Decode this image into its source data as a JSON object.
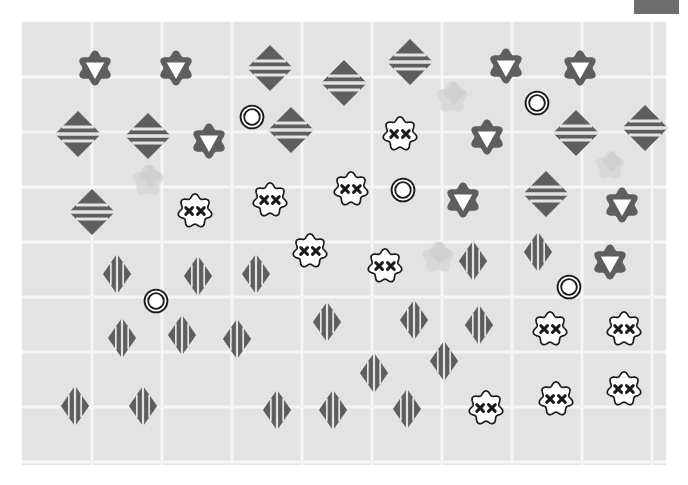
{
  "scene": {
    "title": "abstract-shape-grid-board",
    "canvas": {
      "width": 688,
      "height": 485
    },
    "board": {
      "x": 22,
      "y": 22,
      "width": 644,
      "height": 443
    },
    "background_color": "#ffffff",
    "board_color": "#e3e3e3",
    "grid": {
      "visible": true,
      "line_color": "#f5f5f5",
      "line_width": 3,
      "cell_width": 70,
      "cell_height": 55,
      "columns": 9,
      "rows": 8
    },
    "palette": {
      "dark_gray": "#5e5e5e",
      "mid_gray": "#6e6e6e",
      "ghost_gray": "#d6d6d6",
      "white": "#ffffff",
      "outline_black": "#1a1a1a"
    },
    "hud_block": {
      "label": "hud-block",
      "color": "#6e6e6e",
      "x": 634,
      "y": 0,
      "width": 45,
      "height": 14
    }
  },
  "legend": {
    "types": [
      {
        "key": "flower-triangle",
        "label": "dark flower with white down triangle",
        "color": "#5e5e5e"
      },
      {
        "key": "diamond-hstripe",
        "label": "dark diamond with horizontal stripes",
        "color": "#5e5e5e"
      },
      {
        "key": "diamond-vstripe",
        "label": "dark diamond with vertical stripes",
        "color": "#5e5e5e"
      },
      {
        "key": "cloud-xx",
        "label": "white cloud with two X marks",
        "color": "#ffffff"
      },
      {
        "key": "double-ring",
        "label": "white circle with double ring",
        "color": "#ffffff"
      },
      {
        "key": "ghost-blob",
        "label": "faint gray blob",
        "color": "#d6d6d6"
      }
    ]
  },
  "pieces": [
    {
      "type": "flower-triangle",
      "x": 95,
      "y": 68,
      "size": 46
    },
    {
      "type": "flower-triangle",
      "x": 176,
      "y": 68,
      "size": 46
    },
    {
      "type": "diamond-hstripe",
      "x": 270,
      "y": 68,
      "size": 50
    },
    {
      "type": "diamond-hstripe",
      "x": 344,
      "y": 83,
      "size": 50
    },
    {
      "type": "diamond-hstripe",
      "x": 410,
      "y": 62,
      "size": 50
    },
    {
      "type": "flower-triangle",
      "x": 506,
      "y": 66,
      "size": 46
    },
    {
      "type": "flower-triangle",
      "x": 580,
      "y": 68,
      "size": 46
    },
    {
      "type": "ghost-blob",
      "x": 452,
      "y": 97,
      "size": 42
    },
    {
      "type": "double-ring",
      "x": 252,
      "y": 117,
      "size": 26
    },
    {
      "type": "double-ring",
      "x": 537,
      "y": 103,
      "size": 26
    },
    {
      "type": "diamond-hstripe",
      "x": 78,
      "y": 134,
      "size": 50
    },
    {
      "type": "diamond-hstripe",
      "x": 148,
      "y": 136,
      "size": 50
    },
    {
      "type": "flower-triangle",
      "x": 209,
      "y": 141,
      "size": 46
    },
    {
      "type": "diamond-hstripe",
      "x": 291,
      "y": 130,
      "size": 50
    },
    {
      "type": "cloud-xx",
      "x": 400,
      "y": 134,
      "size": 42
    },
    {
      "type": "flower-triangle",
      "x": 487,
      "y": 137,
      "size": 46
    },
    {
      "type": "diamond-hstripe",
      "x": 576,
      "y": 133,
      "size": 50
    },
    {
      "type": "diamond-hstripe",
      "x": 645,
      "y": 128,
      "size": 50
    },
    {
      "type": "ghost-blob",
      "x": 148,
      "y": 180,
      "size": 42
    },
    {
      "type": "ghost-blob",
      "x": 610,
      "y": 165,
      "size": 38
    },
    {
      "type": "diamond-hstripe",
      "x": 92,
      "y": 212,
      "size": 50
    },
    {
      "type": "cloud-xx",
      "x": 195,
      "y": 211,
      "size": 42
    },
    {
      "type": "cloud-xx",
      "x": 270,
      "y": 200,
      "size": 42
    },
    {
      "type": "cloud-xx",
      "x": 351,
      "y": 189,
      "size": 42
    },
    {
      "type": "double-ring",
      "x": 403,
      "y": 190,
      "size": 26
    },
    {
      "type": "flower-triangle",
      "x": 463,
      "y": 200,
      "size": 46
    },
    {
      "type": "diamond-hstripe",
      "x": 546,
      "y": 194,
      "size": 50
    },
    {
      "type": "flower-triangle",
      "x": 622,
      "y": 205,
      "size": 46
    },
    {
      "type": "cloud-xx",
      "x": 310,
      "y": 251,
      "size": 42
    },
    {
      "type": "cloud-xx",
      "x": 385,
      "y": 266,
      "size": 42
    },
    {
      "type": "ghost-blob",
      "x": 438,
      "y": 257,
      "size": 42
    },
    {
      "type": "diamond-vstripe",
      "x": 473,
      "y": 261,
      "size": 44
    },
    {
      "type": "diamond-vstripe",
      "x": 538,
      "y": 252,
      "size": 44
    },
    {
      "type": "flower-triangle",
      "x": 610,
      "y": 262,
      "size": 46
    },
    {
      "type": "diamond-vstripe",
      "x": 117,
      "y": 274,
      "size": 44
    },
    {
      "type": "diamond-vstripe",
      "x": 198,
      "y": 276,
      "size": 44
    },
    {
      "type": "diamond-vstripe",
      "x": 256,
      "y": 274,
      "size": 44
    },
    {
      "type": "double-ring",
      "x": 156,
      "y": 301,
      "size": 26
    },
    {
      "type": "double-ring",
      "x": 569,
      "y": 287,
      "size": 26
    },
    {
      "type": "diamond-vstripe",
      "x": 122,
      "y": 338,
      "size": 44
    },
    {
      "type": "diamond-vstripe",
      "x": 182,
      "y": 335,
      "size": 44
    },
    {
      "type": "diamond-vstripe",
      "x": 237,
      "y": 339,
      "size": 44
    },
    {
      "type": "diamond-vstripe",
      "x": 327,
      "y": 322,
      "size": 44
    },
    {
      "type": "diamond-vstripe",
      "x": 414,
      "y": 320,
      "size": 44
    },
    {
      "type": "diamond-vstripe",
      "x": 479,
      "y": 325,
      "size": 44
    },
    {
      "type": "cloud-xx",
      "x": 550,
      "y": 329,
      "size": 42
    },
    {
      "type": "cloud-xx",
      "x": 624,
      "y": 329,
      "size": 42
    },
    {
      "type": "diamond-vstripe",
      "x": 374,
      "y": 373,
      "size": 44
    },
    {
      "type": "diamond-vstripe",
      "x": 444,
      "y": 361,
      "size": 44
    },
    {
      "type": "cloud-xx",
      "x": 556,
      "y": 399,
      "size": 42
    },
    {
      "type": "cloud-xx",
      "x": 624,
      "y": 389,
      "size": 42
    },
    {
      "type": "diamond-vstripe",
      "x": 75,
      "y": 406,
      "size": 44
    },
    {
      "type": "diamond-vstripe",
      "x": 143,
      "y": 406,
      "size": 44
    },
    {
      "type": "diamond-vstripe",
      "x": 277,
      "y": 410,
      "size": 44
    },
    {
      "type": "diamond-vstripe",
      "x": 333,
      "y": 410,
      "size": 44
    },
    {
      "type": "diamond-vstripe",
      "x": 407,
      "y": 409,
      "size": 44
    },
    {
      "type": "cloud-xx",
      "x": 486,
      "y": 408,
      "size": 42
    }
  ]
}
